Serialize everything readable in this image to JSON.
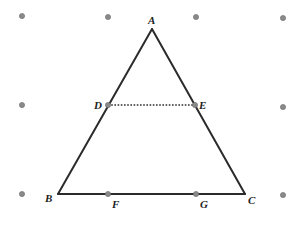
{
  "diagram": {
    "colors": {
      "line": "#2b2b2b",
      "dot": "#8a8a8a",
      "dot_stroke": "#6a6a6a",
      "label": "#222222"
    },
    "grid_dots": [
      {
        "x": 22,
        "y": 16
      },
      {
        "x": 108,
        "y": 17
      },
      {
        "x": 196,
        "y": 17
      },
      {
        "x": 283,
        "y": 18
      },
      {
        "x": 22,
        "y": 105
      },
      {
        "x": 283,
        "y": 107
      },
      {
        "x": 22,
        "y": 194
      },
      {
        "x": 283,
        "y": 195
      }
    ],
    "points": {
      "A": {
        "x": 152,
        "y": 29
      },
      "B": {
        "x": 58,
        "y": 194
      },
      "C": {
        "x": 245,
        "y": 194
      },
      "D": {
        "x": 108,
        "y": 105
      },
      "E": {
        "x": 195,
        "y": 105
      },
      "F": {
        "x": 108,
        "y": 194
      },
      "G": {
        "x": 196,
        "y": 194
      }
    },
    "labels": [
      {
        "text": "A",
        "x": 148,
        "y": 24
      },
      {
        "text": "B",
        "x": 45,
        "y": 202
      },
      {
        "text": "C",
        "x": 248,
        "y": 204
      },
      {
        "text": "D",
        "x": 94,
        "y": 109
      },
      {
        "text": "E",
        "x": 199,
        "y": 109
      },
      {
        "text": "F",
        "x": 112,
        "y": 208
      },
      {
        "text": "G",
        "x": 200,
        "y": 208
      }
    ],
    "solid_segments": [
      [
        "A",
        "B"
      ],
      [
        "A",
        "C"
      ],
      [
        "B",
        "C"
      ]
    ],
    "dotted_segments": [
      [
        "D",
        "E"
      ]
    ],
    "marked_points": [
      "D",
      "E",
      "F",
      "G"
    ]
  }
}
